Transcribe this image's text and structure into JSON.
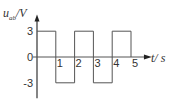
{
  "chart_data": {
    "type": "line",
    "title": "",
    "ylabel": "u",
    "ylabel_sub": "ab",
    "ylabel_unit": "/V",
    "xlabel": "t",
    "xlabel_unit": "/ s",
    "xlim": [
      0,
      5.9
    ],
    "ylim": [
      -4.8,
      4.6
    ],
    "x_ticks": [
      "1",
      "2",
      "3",
      "4",
      "5"
    ],
    "y_ticks": [
      "3",
      "0",
      "-3"
    ],
    "series": [
      {
        "name": "u_ab",
        "shape": "square-wave",
        "points": [
          [
            0,
            3
          ],
          [
            1,
            3
          ],
          [
            1,
            -3
          ],
          [
            2,
            -3
          ],
          [
            2,
            3
          ],
          [
            3,
            3
          ],
          [
            3,
            -3
          ],
          [
            4,
            -3
          ],
          [
            4,
            3
          ],
          [
            5,
            3
          ],
          [
            5,
            0
          ]
        ]
      }
    ],
    "grid": false,
    "legend": "none"
  }
}
